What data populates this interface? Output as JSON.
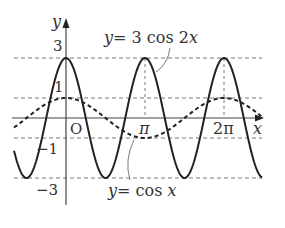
{
  "chart_data": {
    "type": "line",
    "title": "",
    "xlabel": "x",
    "ylabel": "y",
    "origin_label": "O",
    "x_ticks": [
      {
        "value": 3.14159,
        "label": "π"
      },
      {
        "value": 6.28319,
        "label": "2π"
      }
    ],
    "y_ticks": [
      {
        "value": 3,
        "label": "3"
      },
      {
        "value": 1,
        "label": "1"
      },
      {
        "value": -1,
        "label": "−1"
      },
      {
        "value": -3,
        "label": "−3"
      }
    ],
    "xlim": [
      -1.5,
      7.4
    ],
    "ylim": [
      -3.6,
      3.8
    ],
    "guides_dashed": {
      "horizontal": [
        3,
        1,
        -1,
        -3
      ],
      "vertical": [
        3.14159,
        6.28319
      ]
    },
    "series": [
      {
        "name": "y = 3cos 2x",
        "style": "solid",
        "function": "3*cos(2x)",
        "amplitude": 3,
        "period": 3.14159
      },
      {
        "name": "y = cos x",
        "style": "dashed",
        "function": "cos(x)",
        "amplitude": 1,
        "period": 6.28319
      }
    ],
    "annotations": [
      {
        "text": "y = 3 cos 2x",
        "points_to": "solid curve near x ≈ π/2+"
      },
      {
        "text": "y = cos x",
        "points_to": "dashed curve near x ≈ π"
      }
    ]
  },
  "labels": {
    "y_axis": "y",
    "x_axis": "x",
    "origin": "O",
    "three": "3",
    "one": "1",
    "neg_one": "−1",
    "neg_three": "−3",
    "pi": "π",
    "two_pi": "2π",
    "eq1_lhs": "y",
    "eq1_rhs": "= 3 cos 2",
    "eq1_x": "x",
    "eq2_lhs": "y",
    "eq2_rhs": "= cos ",
    "eq2_x": "x"
  },
  "colors": {
    "curve": "#222222",
    "axis": "#444444",
    "guide": "#555555"
  }
}
